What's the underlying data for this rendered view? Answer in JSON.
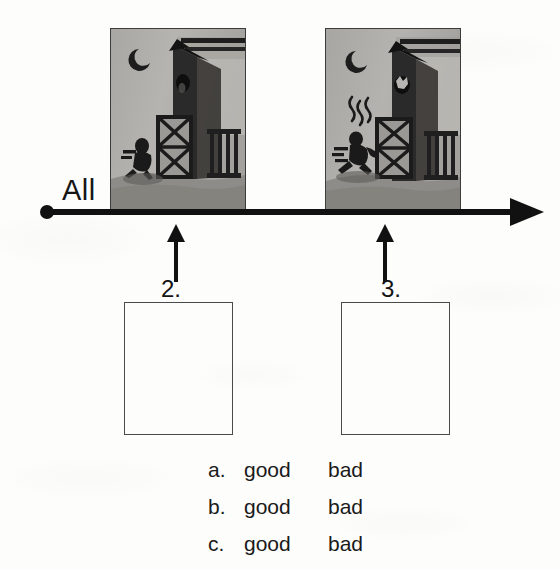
{
  "worksheet": {
    "axis_label": "All",
    "steps": [
      {
        "number": "2.",
        "panel_name": "scene-panel-night-barn-crouching-figure",
        "panel_description": "Night scene: crescent moon, barn with open cross-braced gate, dark crouching figure at lower left"
      },
      {
        "number": "3.",
        "panel_name": "scene-panel-night-barn-running-figure-smoke",
        "panel_description": "Night scene: crescent moon, barn with open cross-braced gate, smoke squiggles and running figure with motion lines"
      }
    ],
    "answer_boxes": [
      {
        "label": "answer-box-2",
        "value": ""
      },
      {
        "label": "answer-box-3",
        "value": ""
      }
    ],
    "rating_options": [
      {
        "letter": "a.",
        "good": "good",
        "bad": "bad"
      },
      {
        "letter": "b.",
        "good": "good",
        "bad": "bad"
      },
      {
        "letter": "c.",
        "good": "good",
        "bad": "bad"
      }
    ]
  },
  "colors": {
    "ink": "#111111",
    "panel_border": "#3c3c3c",
    "panel_sky": "#b4b2ae",
    "panel_ground": "#8e8c88",
    "panel_dark": "#232323",
    "box_border": "#4a4a4a",
    "paper": "#fdfdfc"
  }
}
